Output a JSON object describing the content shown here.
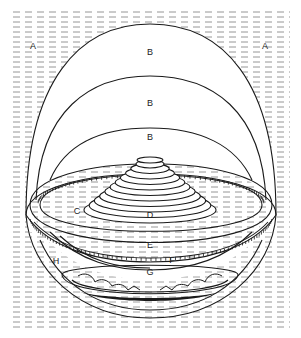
{
  "diagram": {
    "labels": {
      "a_left": "A",
      "a_right": "A",
      "b_outer": "B",
      "b_middle": "B",
      "b_inner": "B",
      "c": "C",
      "d": "D",
      "e": "E",
      "f": "F",
      "g": "G",
      "h": "H"
    },
    "colors": {
      "line": "#1a1a1a",
      "hatch": "#8a8a8a",
      "background": "#ffffff"
    }
  }
}
